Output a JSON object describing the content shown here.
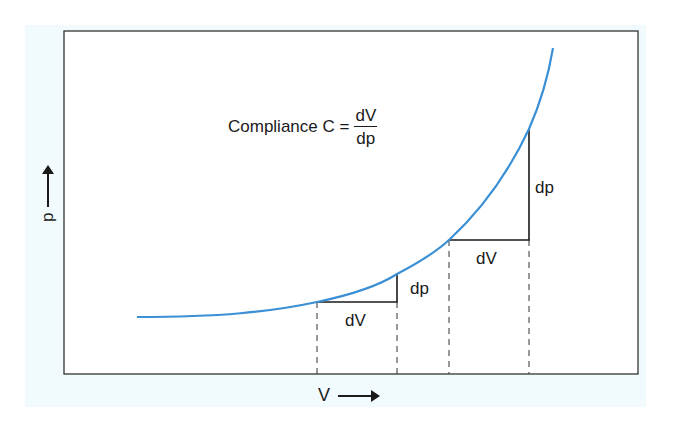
{
  "figure": {
    "formula": {
      "prefix": "Compliance C =",
      "numerator": "dV",
      "denominator": "dp"
    },
    "axes": {
      "x_label": "V",
      "y_label": "p"
    },
    "triangles": [
      {
        "dv_label": "dV",
        "dp_label": "dp"
      },
      {
        "dv_label": "dV",
        "dp_label": "dp"
      }
    ],
    "colors": {
      "curve": "#3b8fd4",
      "background_panel": "#f1fbfd",
      "lines": "#1a1a1a"
    }
  }
}
